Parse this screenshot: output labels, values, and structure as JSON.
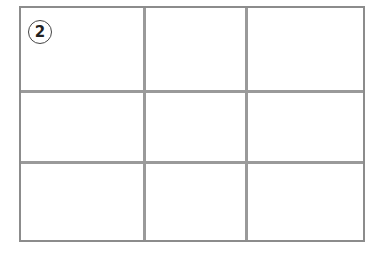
{
  "figure": {
    "badge_number": "2",
    "grid": {
      "rows": 3,
      "columns": 3
    },
    "colors": {
      "lines": "#9a9a9a",
      "border": "#8c8c8c",
      "badge_text": "#222222"
    }
  }
}
